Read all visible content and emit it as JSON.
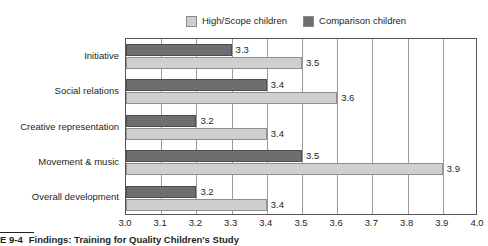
{
  "legend": {
    "entries": [
      {
        "label": "High/Scope children",
        "color": "#cfcfcf",
        "icon": "legend-swatch-light"
      },
      {
        "label": "Comparison children",
        "color": "#6e6e6e",
        "icon": "legend-swatch-dark"
      }
    ]
  },
  "caption": {
    "number": "E 9-4",
    "text": "Findings: Training for Quality Children's Study"
  },
  "chart_data": {
    "type": "bar",
    "orientation": "horizontal",
    "title": "",
    "xlabel": "",
    "ylabel": "",
    "xlim": [
      3.0,
      4.0
    ],
    "xticks": [
      "3.0",
      "3.1",
      "3.2",
      "3.3",
      "3.4",
      "3.5",
      "3.6",
      "3.7",
      "3.8",
      "3.9",
      "4.0"
    ],
    "xtick_values": [
      3.0,
      3.1,
      3.2,
      3.3,
      3.4,
      3.5,
      3.6,
      3.7,
      3.8,
      3.9,
      4.0
    ],
    "grid": true,
    "grid_axis": "x",
    "legend_position": "top-center",
    "categories": [
      "Initiative",
      "Social relations",
      "Creative representation",
      "Movement & music",
      "Overall development"
    ],
    "series": [
      {
        "name": "Comparison children",
        "color": "#6e6e6e",
        "values": [
          3.3,
          3.4,
          3.2,
          3.5,
          3.2
        ],
        "labels": [
          "3.3",
          "3.4",
          "3.2",
          "3.5",
          "3.2"
        ]
      },
      {
        "name": "High/Scope children",
        "color": "#cfcfcf",
        "values": [
          3.5,
          3.6,
          3.4,
          3.9,
          3.4
        ],
        "labels": [
          "3.5",
          "3.6",
          "3.4",
          "3.9",
          "3.4"
        ]
      }
    ]
  }
}
